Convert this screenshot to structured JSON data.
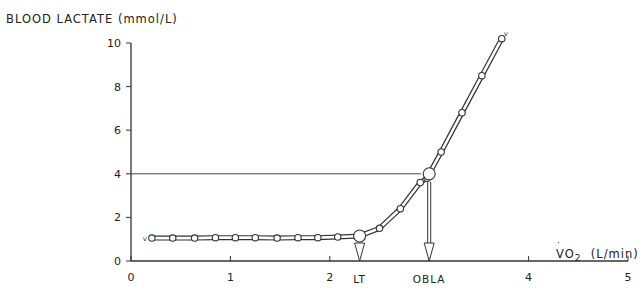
{
  "chart_data": {
    "type": "line",
    "title": "",
    "ylabel": "BLOOD LACTATE (mmol/L)",
    "xlabel": "VO2 (L/min)",
    "xlim": [
      0,
      5
    ],
    "ylim": [
      0,
      10
    ],
    "xticks": [
      0,
      1,
      2,
      3,
      4,
      5
    ],
    "xtick_labels": [
      "0",
      "1",
      "2",
      "",
      "4",
      "5"
    ],
    "yticks": [
      0,
      2,
      4,
      6,
      8,
      10
    ],
    "ytick_labels": [
      "0",
      "2",
      "4",
      "6",
      "8",
      "10"
    ],
    "grid": false,
    "series": [
      {
        "name": "Blood lactate",
        "x": [
          0.21,
          0.42,
          0.64,
          0.85,
          1.05,
          1.25,
          1.47,
          1.68,
          1.88,
          2.08,
          2.3,
          2.5,
          2.71,
          2.91,
          2.98,
          3.0,
          3.12,
          3.33,
          3.53,
          3.73
        ],
        "y": [
          1.05,
          1.05,
          1.05,
          1.07,
          1.07,
          1.07,
          1.05,
          1.07,
          1.07,
          1.1,
          1.15,
          1.5,
          2.4,
          3.6,
          3.8,
          4.0,
          5.0,
          6.8,
          8.5,
          10.2
        ]
      }
    ],
    "annotations": [
      {
        "label": "LT",
        "x": 2.3,
        "y": 1.15,
        "description": "Lactate threshold, arrow down to x-axis"
      },
      {
        "label": "OBLA",
        "x": 3.0,
        "y": 4.0,
        "description": "Onset of blood lactate accumulation at 4 mmol/L, horizontal reference line at y=4 and arrow down to x-axis"
      }
    ],
    "reference_lines": [
      {
        "axis": "y",
        "value": 4
      }
    ]
  },
  "labels": {
    "y_axis": "BLOOD LACTATE  (mmol/L)",
    "x_axis_main": "VO",
    "x_axis_sub": "2",
    "x_axis_unit": "  (L/min)",
    "lt": "LT",
    "obla": "OBLA"
  }
}
